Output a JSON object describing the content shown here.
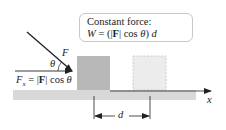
{
  "callout": {
    "title": "Constant force:",
    "formula_prefix": "W",
    "formula_eq": " = (",
    "formula_bar_open": "|",
    "formula_F": "F",
    "formula_bar_close": "|",
    "formula_cos": " cos ",
    "formula_theta": "θ",
    "formula_close": ") ",
    "formula_d": "d"
  },
  "labels": {
    "force": "F",
    "angle": "θ",
    "fx_F": "F",
    "fx_sub": "x",
    "fx_eq": " = ",
    "fx_bar_open": "|",
    "fx_bold_F": "F",
    "fx_bar_close": "|",
    "fx_cos": " cos ",
    "fx_theta": "θ",
    "axis_x": "x",
    "displacement": "d"
  },
  "colors": {
    "box_initial": "#b8b8b8",
    "box_final": "#ececec",
    "box_final_border": "#c4c4c4",
    "ground": "#d8d8d8",
    "line": "#222222",
    "callout_border": "#c8c8c8"
  }
}
